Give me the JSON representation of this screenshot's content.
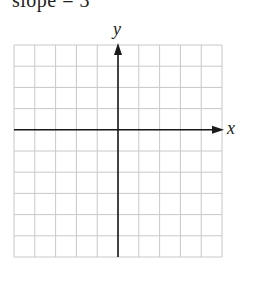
{
  "caption": {
    "text": "slope = 3",
    "clipped": true
  },
  "graph": {
    "grid": {
      "columns": 10,
      "rows": 10,
      "left": 14,
      "top": 45,
      "cell_width": 20.8,
      "cell_height": 21.2,
      "line_color": "#c8c8c8"
    },
    "axes": {
      "color": "#1a1a1a",
      "x_axis_row": 4,
      "y_axis_column": 5,
      "x_label": "x",
      "y_label": "y",
      "arrows": [
        "positive-x",
        "positive-y"
      ]
    }
  }
}
